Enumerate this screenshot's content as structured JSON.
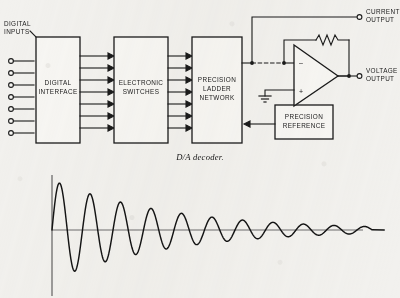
{
  "figure": {
    "caption": "D/A decoder.",
    "domain": "block-diagram",
    "background_color": "#f2f1ee",
    "ink_color": "#1b1b1b",
    "block_fill": "#f7f6f3"
  },
  "diagram": {
    "input_bus": {
      "label_line1": "DIGITAL",
      "label_line2": "INPUTS",
      "terminal_count": 7
    },
    "blocks": [
      {
        "id": "digital-interface",
        "lines": [
          "DIGITAL",
          "INTERFACE"
        ]
      },
      {
        "id": "electronic-switches",
        "lines": [
          "ELECTRONIC",
          "SWITCHES"
        ]
      },
      {
        "id": "precision-ladder",
        "lines": [
          "PRECISION",
          "LADDER",
          "NETWORK"
        ]
      },
      {
        "id": "precision-reference",
        "lines": [
          "PRECISION",
          "REFERENCE"
        ]
      }
    ],
    "bus_arrows": {
      "stage1_count": 7,
      "stage2_count": 7
    },
    "amplifier": {
      "type": "operational-amplifier",
      "inverting_input_sign": "–",
      "noninverting_input_sign": "+",
      "feedback": "resistor",
      "noninverting_tie": "ground"
    },
    "outputs": [
      {
        "id": "current-output",
        "line1": "CURRENT",
        "line2": "OUTPUT"
      },
      {
        "id": "voltage-output",
        "line1": "VOLTAGE",
        "line2": "OUTPUT"
      }
    ]
  },
  "chart_data": {
    "type": "line",
    "title": "",
    "xlabel": "",
    "ylabel": "",
    "grid": false,
    "legend": null,
    "axes": {
      "origin_px": [
        52,
        230
      ],
      "x_axis_visible": true,
      "y_axis_visible": true
    },
    "model": {
      "function": "A0 * exp(-t/tau) * sin(2*pi*f*t)",
      "A0": 50,
      "tau_px": 118,
      "period_px": 30.5,
      "cycles": 10.5
    },
    "peaks": [
      {
        "cycle": 1,
        "x": 61,
        "y_value": 48
      },
      {
        "cycle": 1,
        "x": 76,
        "y_value": -41
      },
      {
        "cycle": 2,
        "x": 91,
        "y_value": 36
      },
      {
        "cycle": 2,
        "x": 106,
        "y_value": -31
      },
      {
        "cycle": 3,
        "x": 122,
        "y_value": 27
      },
      {
        "cycle": 3,
        "x": 137,
        "y_value": -23
      },
      {
        "cycle": 4,
        "x": 152,
        "y_value": 20
      },
      {
        "cycle": 4,
        "x": 167,
        "y_value": -17
      },
      {
        "cycle": 5,
        "x": 183,
        "y_value": 15
      },
      {
        "cycle": 5,
        "x": 198,
        "y_value": -13
      },
      {
        "cycle": 6,
        "x": 213,
        "y_value": 11
      },
      {
        "cycle": 6,
        "x": 228,
        "y_value": -9
      },
      {
        "cycle": 7,
        "x": 244,
        "y_value": 7.5
      },
      {
        "cycle": 7,
        "x": 259,
        "y_value": -6.4
      },
      {
        "cycle": 8,
        "x": 274,
        "y_value": 5.4
      },
      {
        "cycle": 8,
        "x": 289,
        "y_value": -4.6
      },
      {
        "cycle": 9,
        "x": 305,
        "y_value": 3.8
      },
      {
        "cycle": 9,
        "x": 320,
        "y_value": -3.2
      },
      {
        "cycle": 10,
        "x": 335,
        "y_value": 2.6
      },
      {
        "cycle": 10,
        "x": 350,
        "y_value": -2.0
      }
    ]
  }
}
